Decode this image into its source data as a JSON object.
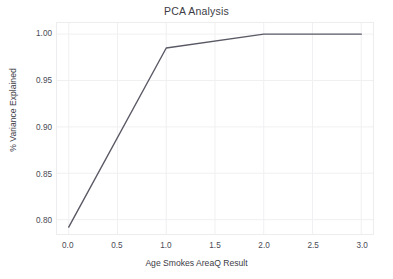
{
  "chart_data": {
    "type": "line",
    "title": "PCA Analysis",
    "xlabel": "Age Smokes AreaQ Result",
    "ylabel": "% Variance Explained",
    "x": [
      0.0,
      1.0,
      2.0,
      3.0
    ],
    "values": [
      0.792,
      0.985,
      1.0,
      1.0
    ],
    "series": [
      {
        "name": "Cumulative Explained Variance",
        "values": [
          0.792,
          0.985,
          1.0,
          1.0
        ]
      }
    ],
    "xlim": [
      -0.12,
      3.12
    ],
    "ylim": [
      0.7845,
      1.012
    ],
    "xticks": [
      0.0,
      0.5,
      1.0,
      1.5,
      2.0,
      2.5,
      3.0
    ],
    "xticklabels": [
      "0.0",
      "0.5",
      "1.0",
      "1.5",
      "2.0",
      "2.5",
      "3.0"
    ],
    "yticks": [
      0.8,
      0.85,
      0.9,
      0.95,
      1.0
    ],
    "yticklabels": [
      "0.80",
      "0.85",
      "0.90",
      "0.95",
      "1.00"
    ],
    "grid": true,
    "legend": false,
    "line_color": "#5a5a66",
    "grid_color": "#f0f0f3",
    "background_color": "#ffffff"
  }
}
